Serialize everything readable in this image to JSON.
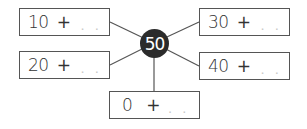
{
  "diagram": {
    "center": {
      "value": "50",
      "color": "#2b2b2b"
    },
    "boxes": [
      {
        "number": "10",
        "operator": "+",
        "blank": ". ."
      },
      {
        "number": "20",
        "operator": "+",
        "blank": ". ."
      },
      {
        "number": "30",
        "operator": "+",
        "blank": ". ."
      },
      {
        "number": "40",
        "operator": "+",
        "blank": ". ."
      },
      {
        "number": "0",
        "operator": "+",
        "blank": ". ."
      }
    ]
  }
}
